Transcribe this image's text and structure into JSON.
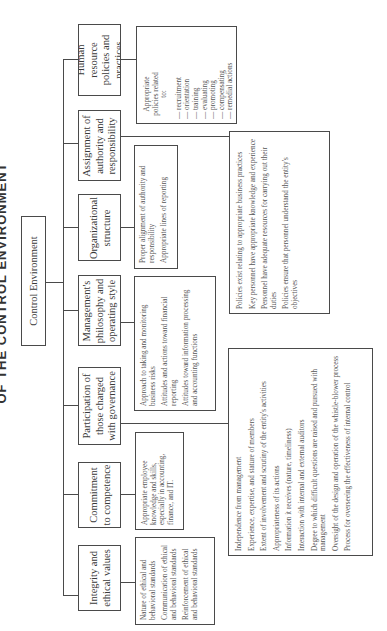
{
  "header": {
    "title": "OF THE CONTROL ENVIRONMENT"
  },
  "root": {
    "label": "Control Environment"
  },
  "components": [
    {
      "id": "hr",
      "label": "Human resource policies and practices",
      "details": {
        "intro": "Appropriate policies related to:",
        "items": [
          "recruitment",
          "orientation",
          "training",
          "evaluating",
          "promoting",
          "compensating",
          "remedial actions"
        ]
      }
    },
    {
      "id": "assignment",
      "label": "Assignment of authority and responsibility",
      "details": {
        "items": [
          "Policies exist relating to appropriate business practices",
          "Key personnel have appropriate knowledge and experience",
          "Personnel have adequate resources for carrying out their duties",
          "Policies ensure that personnel understand the entity's objectives"
        ]
      }
    },
    {
      "id": "org",
      "label": "Organizational structure",
      "details": {
        "items": [
          "Proper alignment of authority and responsibility",
          "Appropriate lines of reporting"
        ]
      }
    },
    {
      "id": "management",
      "label": "Management's philosophy and operating style",
      "details": {
        "items": [
          "Approach to taking and monitoring business risks",
          "Attitudes and actions toward financial reporting",
          "Attitudes toward information processing and accounting functions"
        ]
      }
    },
    {
      "id": "governance",
      "label": "Participation of those charged with governance",
      "details": {
        "items": [
          "Independence from management",
          "Experience, expertise, and stature of members",
          "Extent of involvement and scrutiny of the entity's activities",
          "Appropriateness of its actions",
          "Information it receives (nature, timeliness)",
          "Interaction with internal and external auditors",
          "Degree to which difficult questions are raised and pursued with management",
          "Oversight of the design and operation of the whistle-blower process",
          "Process for overseeing the effectiveness of internal control"
        ]
      }
    },
    {
      "id": "competence",
      "label": "Commitment to competence",
      "details": {
        "items": [
          "Appropriate employee knowledge and skills, especially in accounting, finance, and IT."
        ]
      }
    },
    {
      "id": "integrity",
      "label": "Integrity and ethical values",
      "details": {
        "items": [
          "Nature of ethical and behavioral standards",
          "Communication of ethical and behavioral standards",
          "Reinforcement of ethical and behavioral standards"
        ]
      }
    }
  ]
}
